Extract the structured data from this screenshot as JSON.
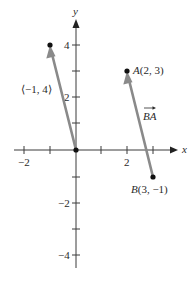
{
  "diagram": {
    "type": "coordinate-plane-vectors",
    "axes": {
      "x_label": "x",
      "y_label": "y",
      "x_range": [
        -2,
        3
      ],
      "y_range": [
        -4,
        4
      ],
      "x_tick_labels": [
        "−2",
        "2"
      ],
      "y_tick_labels": [
        "4",
        "2",
        "−2",
        "−4"
      ]
    },
    "points": [
      {
        "name": "origin",
        "x": 0,
        "y": 0,
        "label": ""
      },
      {
        "name": "tip",
        "x": -1,
        "y": 4,
        "label": "⟨−1, 4⟩"
      },
      {
        "name": "A",
        "x": 2,
        "y": 3,
        "label_prefix": "A",
        "label_coords": "(2, 3)"
      },
      {
        "name": "B",
        "x": 3,
        "y": -1,
        "label_prefix": "B",
        "label_coords": "(3, −1)"
      }
    ],
    "vectors": [
      {
        "name": "position-vector",
        "from": [
          0,
          0
        ],
        "to": [
          -1,
          4
        ],
        "label": "⟨−1, 4⟩"
      },
      {
        "name": "vector-BA",
        "from": [
          3,
          -1
        ],
        "to": [
          2,
          3
        ],
        "label": "BA"
      }
    ],
    "colors": {
      "vector": "#8a8a8a",
      "axis": "#3a3a3a",
      "point": "#111111"
    }
  }
}
